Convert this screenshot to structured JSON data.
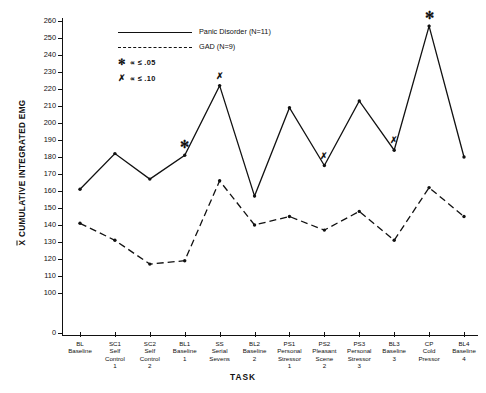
{
  "chart_data": {
    "type": "line",
    "title": "",
    "xlabel": "TASK",
    "ylabel": "X CUMULATIVE INTEGRATED EMG",
    "ylabel_prefix": "X",
    "ylabel_rest": " CUMULATIVE INTEGRATED EMG",
    "ylim": [
      100,
      260
    ],
    "yticks": [
      100,
      110,
      120,
      130,
      140,
      150,
      160,
      170,
      180,
      190,
      200,
      210,
      220,
      230,
      240,
      250,
      260
    ],
    "ytick_zero": 0,
    "axis_break": true,
    "grid": false,
    "legend_position": "top-left",
    "categories": [
      "BL\nBaseline",
      "SC1\nSelf\nControl\n1",
      "SC2\nSelf\nControl\n2",
      "BL1\nBaseline\n1",
      "SS\nSerial\nSevens",
      "BL2\nBaseline\n2",
      "PS1\nPersonal\nStressor\n1",
      "PS2\nPleasant\nScene\n2",
      "PS3\nPersonal\nStressor\n3",
      "BL3\nBaseline\n3",
      "CP\nCold\nPressor",
      "BL4\nBaseline\n4"
    ],
    "series": [
      {
        "name": "Panic Disorder (N=11)",
        "style": "solid",
        "values": [
          161,
          182,
          167,
          181,
          222,
          157,
          209,
          175,
          213,
          184,
          257,
          180
        ]
      },
      {
        "name": "GAD (N=9)",
        "style": "dashed",
        "values": [
          141,
          131,
          117,
          119,
          166,
          140,
          145,
          137,
          148,
          131,
          162,
          145
        ]
      }
    ],
    "annotations": [
      {
        "marker": "asterisk",
        "series": "Panic Disorder (N=11)",
        "category_index": 3,
        "value": 181
      },
      {
        "marker": "x",
        "series": "Panic Disorder (N=11)",
        "category_index": 4,
        "value": 222
      },
      {
        "marker": "x",
        "series": "Panic Disorder (N=11)",
        "category_index": 7,
        "value": 175
      },
      {
        "marker": "x",
        "series": "Panic Disorder (N=11)",
        "category_index": 9,
        "value": 184
      },
      {
        "marker": "asterisk",
        "series": "Panic Disorder (N=11)",
        "category_index": 10,
        "value": 257
      }
    ]
  },
  "legend": {
    "entries": [
      {
        "label": "Panic Disorder (N=11)",
        "style": "solid"
      },
      {
        "label": "GAD (N=9)",
        "style": "dashed"
      }
    ],
    "significance": [
      {
        "mark": "✻",
        "text": "∝ ≤ .05"
      },
      {
        "mark": "✗",
        "text": "∝ ≤ .10"
      }
    ]
  }
}
